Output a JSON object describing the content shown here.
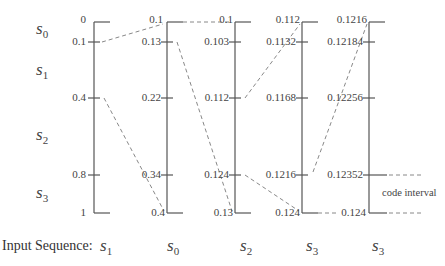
{
  "figure": {
    "symbols": [
      {
        "name": "s",
        "sub": "0"
      },
      {
        "name": "s",
        "sub": "1"
      },
      {
        "name": "s",
        "sub": "2"
      },
      {
        "name": "s",
        "sub": "3"
      }
    ],
    "axes": [
      {
        "ticks": [
          "0",
          "0.1",
          "0.4",
          "0.8",
          "1"
        ]
      },
      {
        "ticks": [
          "0.1",
          "0.13",
          "0.22",
          "0.34",
          "0.4"
        ]
      },
      {
        "ticks": [
          "0.1",
          "0.103",
          "0.112",
          "0.124",
          "0.13"
        ]
      },
      {
        "ticks": [
          "0.112",
          "0.1132",
          "0.1168",
          "0.1216",
          "0.124"
        ]
      },
      {
        "ticks": [
          "0.1216",
          "0.12184",
          "0.12256",
          "0.12352",
          "0.124"
        ]
      }
    ],
    "input_sequence": {
      "label": "Input Sequence:",
      "symbols": [
        {
          "name": "s",
          "sub": "1"
        },
        {
          "name": "s",
          "sub": "0"
        },
        {
          "name": "s",
          "sub": "2"
        },
        {
          "name": "s",
          "sub": "3"
        },
        {
          "name": "s",
          "sub": "3"
        }
      ]
    },
    "code_interval_label": "code interval",
    "colors": {
      "axis": "#555555",
      "dashed": "#888888",
      "text": "#444444"
    }
  }
}
